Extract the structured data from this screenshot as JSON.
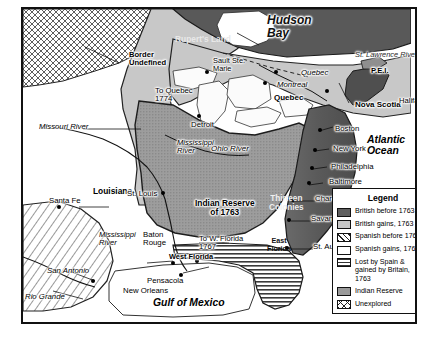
{
  "map": {
    "title_regions": [
      {
        "name": "Hudson Bay",
        "style": "ocean"
      },
      {
        "name": "Rupert's Land",
        "style": "region"
      },
      {
        "name": "Atlantic Ocean",
        "style": "ocean"
      },
      {
        "name": "Gulf of Mexico",
        "style": "ocean"
      }
    ],
    "labels": {
      "hudson_bay": "Hudson\nBay",
      "ruperts_land": "Rupert's Land",
      "border_undefined": "Border\nUndefined",
      "st_lawrence_river": "St. Lawrence River",
      "pei": "P.E.I.",
      "nova_scotia": "Nova Scotia",
      "halifax": "Halifax",
      "quebec_city": "Quebec",
      "montreal": "Montreal",
      "quebec_province": "Quebec",
      "sault_ste_marie": "Sault Ste.\nMarie",
      "to_quebec_1774": "To Quebec\n1774",
      "detroit": "Detroit",
      "ohio_river": "Ohio River",
      "mississippi_river_north": "Mississippi\nRiver",
      "mississippi_river_south": "Mississippi\nRiver",
      "missouri_river": "Missouri River",
      "louisiana": "Louisiana",
      "santa_fe": "Santa Fe",
      "san_antonio": "San Antonio",
      "rio_grande": "Rio Grande",
      "st_louis": "St. Louis",
      "indian_reserve_1763": "Indian Reserve\nof 1763",
      "thirteen_colonies": "Thirteen\nColonies",
      "boston": "Boston",
      "new_york": "New York",
      "philadelphia": "Philadelphia",
      "baltimore": "Baltimore",
      "charleston": "Charleston",
      "savannah": "Savannah",
      "st_augustine": "St. Augustine",
      "east_florida": "East\nFlorida",
      "west_florida": "West Florida",
      "to_w_florida_1767": "To W. Florida\n1767",
      "pensacola": "Pensacola",
      "baton_rouge": "Baton\nRouge",
      "new_orleans": "New Orleans",
      "atlantic_ocean": "Atlantic\nOcean",
      "gulf_of_mexico": "Gulf of Mexico"
    }
  },
  "legend": {
    "title": "Legend",
    "items": [
      {
        "label": "British before 1763",
        "pattern": "solid-dark-gray",
        "color": "#5f5f5f"
      },
      {
        "label": "British gains, 1763",
        "pattern": "solid-light-gray",
        "color": "#c6c6c6"
      },
      {
        "label": "Spanish before 1762",
        "pattern": "diagonal-hatch",
        "color": "#ffffff"
      },
      {
        "label": "Spanish gains, 1762",
        "pattern": "solid-white",
        "color": "#ffffff"
      },
      {
        "label": "Lost by Spain &\ngained by Britain,\n1763",
        "pattern": "horizontal-stripes",
        "color": "#ffffff"
      },
      {
        "label": "Indian Reserve",
        "pattern": "solid-medium-gray",
        "color": "#9a9a9a"
      },
      {
        "label": "Unexplored",
        "pattern": "crosshatch",
        "color": "#ffffff"
      }
    ]
  }
}
